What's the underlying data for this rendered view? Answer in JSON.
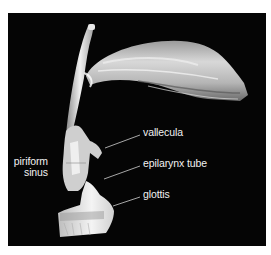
{
  "figure": {
    "background": "#050505",
    "label_color": "#f2f2f2",
    "labels": {
      "piriform_sinus": {
        "line1": "piriform",
        "line2": "sinus"
      },
      "vallecula": "vallecula",
      "epilarynx_tube": "epilarynx tube",
      "glottis": "glottis"
    }
  }
}
